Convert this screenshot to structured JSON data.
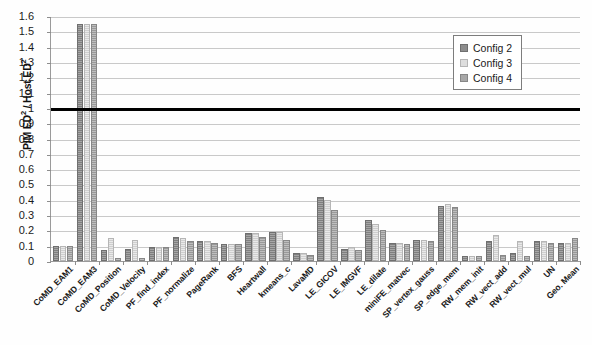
{
  "chart_data": {
    "type": "bar",
    "title": "",
    "xlabel": "",
    "ylabel": "PIM ED² / Host ED²",
    "ylim": [
      0,
      1.6
    ],
    "ytick_step": 0.1,
    "yticks": [
      "1.6",
      "1.5",
      "1.4",
      "1.3",
      "1.2",
      "1.1",
      "1",
      "0.9",
      "0.8",
      "0.7",
      "0.6",
      "0.5",
      "0.4",
      "0.3",
      "0.2",
      "0.1",
      "0"
    ],
    "grid": true,
    "legend_position": "top-right",
    "reference_line": {
      "value": 1,
      "label": "Host ED² = 1",
      "color": "#000000"
    },
    "categories": [
      "CoMD_EAM1",
      "CoMD_EAM3",
      "CoMD_Position",
      "CoMD_Velocity",
      "PF_find_index",
      "PF_normalize",
      "PageRank",
      "BFS",
      "Heartwall",
      "kmeans_c",
      "LavaMD",
      "LE_GICOV",
      "LE_IMGVF",
      "LE_dilate",
      "miniFE_matvec",
      "SP_vertex_gauss",
      "SP_edge_mem",
      "RW_mem_init",
      "RW_vect_add",
      "RW_vect_mul",
      "UN",
      "Geo. Mean"
    ],
    "series": [
      {
        "name": "Config 2",
        "color": "#8d8d8d",
        "values": [
          0.1,
          1.55,
          0.07,
          0.08,
          0.09,
          0.16,
          0.13,
          0.11,
          0.18,
          0.19,
          0.05,
          0.42,
          0.08,
          0.27,
          0.12,
          0.14,
          0.36,
          0.03,
          0.13,
          0.05,
          0.13,
          0.12
        ]
      },
      {
        "name": "Config 3",
        "color": "#dedede",
        "values": [
          0.1,
          1.55,
          0.15,
          0.14,
          0.09,
          0.15,
          0.13,
          0.11,
          0.18,
          0.19,
          0.05,
          0.4,
          0.09,
          0.24,
          0.12,
          0.14,
          0.37,
          0.03,
          0.17,
          0.13,
          0.13,
          0.12
        ]
      },
      {
        "name": "Config 4",
        "color": "#a8a8a8",
        "values": [
          0.1,
          1.55,
          0.02,
          0.02,
          0.09,
          0.13,
          0.12,
          0.11,
          0.16,
          0.14,
          0.04,
          0.33,
          0.07,
          0.2,
          0.11,
          0.13,
          0.35,
          0.03,
          0.04,
          0.03,
          0.12,
          0.15
        ]
      }
    ]
  },
  "legend": {
    "items": [
      {
        "label": "Config 2"
      },
      {
        "label": "Config 3"
      },
      {
        "label": "Config 4"
      }
    ]
  }
}
